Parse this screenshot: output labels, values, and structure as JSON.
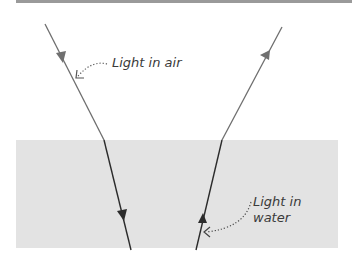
{
  "labels": {
    "air": "Light in air",
    "water_line1": "Light in",
    "water_line2": "water"
  },
  "colors": {
    "background": "#ffffff",
    "water": "#e3e3e3",
    "air_ray": "#6e6e6e",
    "water_ray": "#2b2b2b",
    "rule": "#9a9a9a"
  }
}
